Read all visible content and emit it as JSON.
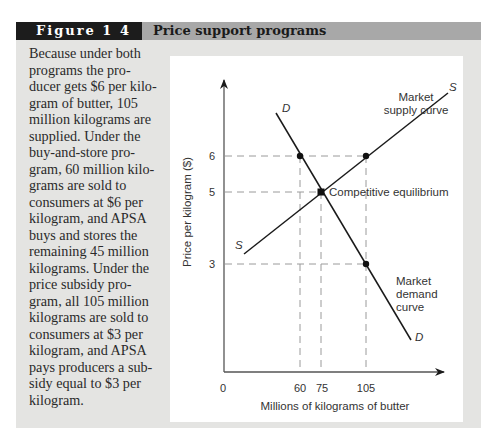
{
  "figure": {
    "label": "Figure 1 4",
    "title": "Price support programs"
  },
  "caption": "Because under both programs the producer gets $6 per kilogram of butter, 105 million kilograms are supplied. Under the buy-and-store program, 60 million kilograms are sold to consumers at $6 per kilogram, and APSA buys and stores the remaining 45 million kilograms. Under the price subsidy program, all 105 million kilograms are sold to consumers at $3 per kilogram, and APSA pays producers a subsidy equal to $3 per kilogram.",
  "caption_lines": [
    "Because under both",
    "programs the pro-",
    "ducer gets $6 per kilo-",
    "gram of butter, 105",
    "million kilograms are",
    "supplied. Under the",
    "buy-and-store pro-",
    "gram, 60 million kilo-",
    "grams are sold to",
    "consumers at $6 per",
    "kilogram, and APSA",
    "buys and stores the",
    "remaining 45 million",
    "kilograms. Under the",
    "price subsidy pro-",
    "gram, all 105 million",
    "kilograms are sold to",
    "consumers at $3 per",
    "kilogram, and APSA",
    "pays producers a sub-",
    "sidy equal to $3 per",
    "kilogram."
  ],
  "chart": {
    "ylabel": "Price per kilogram ($)",
    "xlabel": "Millions of kilograms of butter",
    "y_ticks": [
      "6",
      "5",
      "3"
    ],
    "x_ticks": [
      "0",
      "60",
      "75",
      "105"
    ],
    "supply_label_top": "S",
    "supply_label_bottom": "S",
    "demand_label_top": "D",
    "demand_label_bottom": "D",
    "supply_curve_label_1": "Market",
    "supply_curve_label_2": "supply curve",
    "demand_curve_label_1": "Market",
    "demand_curve_label_2": "demand",
    "demand_curve_label_3": "curve",
    "equilibrium_label": "Competitive equilibrium"
  },
  "chart_data": {
    "type": "line",
    "title": "Price support programs",
    "xlabel": "Millions of kilograms of butter",
    "ylabel": "Price per kilogram ($)",
    "x_ticks": [
      0,
      60,
      75,
      105
    ],
    "y_ticks": [
      3,
      5,
      6
    ],
    "series": [
      {
        "name": "Market supply curve (S)",
        "points": [
          [
            25,
            3.4
          ],
          [
            75,
            5
          ],
          [
            105,
            6
          ],
          [
            133,
            7.9
          ]
        ]
      },
      {
        "name": "Market demand curve (D)",
        "points": [
          [
            38,
            7.1
          ],
          [
            60,
            6
          ],
          [
            75,
            5
          ],
          [
            105,
            3
          ],
          [
            134,
            1.1
          ]
        ]
      }
    ],
    "marked_points": [
      {
        "x": 60,
        "y": 6,
        "label": ""
      },
      {
        "x": 105,
        "y": 6,
        "label": ""
      },
      {
        "x": 75,
        "y": 5,
        "label": "Competitive equilibrium"
      },
      {
        "x": 105,
        "y": 3,
        "label": ""
      }
    ],
    "reference_lines": {
      "horizontal": [
        6,
        5,
        3
      ],
      "vertical": [
        60,
        75,
        105
      ],
      "style": "dashed"
    },
    "grid": false
  }
}
